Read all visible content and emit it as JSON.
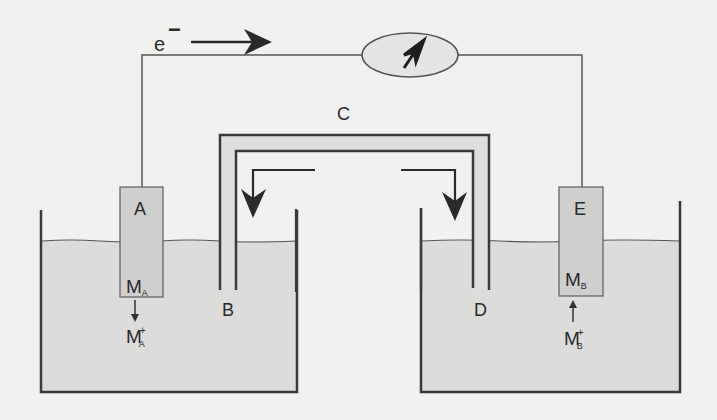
{
  "diagram": {
    "type": "galvanic-cell-with-salt-bridge",
    "electron_label": "e",
    "electron_charge": "−",
    "meter": {
      "name": "galvanometer"
    },
    "labels": {
      "anode": "A",
      "salt_bridge": "C",
      "left_tube_end": "B",
      "right_tube_end": "D",
      "cathode": "E"
    },
    "anode_metal": {
      "base": "M",
      "sub": "A"
    },
    "anode_ion": {
      "base": "M",
      "sub": "A",
      "sup": "+"
    },
    "cathode_metal": {
      "base": "M",
      "sub": "B"
    },
    "cathode_ion": {
      "base": "M",
      "sub": "B",
      "sup": "+"
    }
  },
  "colors": {
    "background": "#f1f1ef",
    "line": "#3a3a3a",
    "solution": "#dcdcda",
    "electrode": "#cfcfcd",
    "bridge_fill": "#dededc",
    "meter_fill": "#e4e4e2"
  }
}
